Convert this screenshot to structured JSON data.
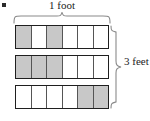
{
  "figure": {
    "bullet": "",
    "top_measure_label": "1 foot",
    "right_measure_label": "3 feet",
    "shade_color": "#c8c8c8",
    "line_color": "#1f1f1f",
    "grid": {
      "rows": 3,
      "columns": 6,
      "cells": [
        [
          {
            "shaded": true
          },
          {
            "shaded": false
          },
          {
            "shaded": true
          },
          {
            "shaded": false
          },
          {
            "shaded": false
          },
          {
            "shaded": false
          }
        ],
        [
          {
            "shaded": true
          },
          {
            "shaded": true
          },
          {
            "shaded": true
          },
          {
            "shaded": false
          },
          {
            "shaded": false
          },
          {
            "shaded": false
          }
        ],
        [
          {
            "shaded": false
          },
          {
            "shaded": false
          },
          {
            "shaded": false
          },
          {
            "shaded": false
          },
          {
            "shaded": true
          },
          {
            "shaded": true
          }
        ]
      ]
    }
  }
}
